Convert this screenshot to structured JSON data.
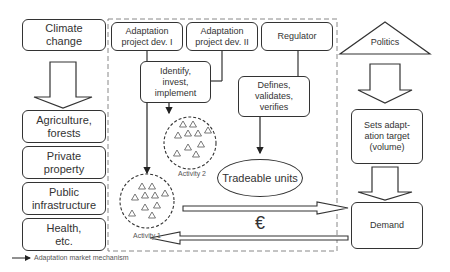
{
  "left_column": {
    "top": "Climate\nchange",
    "sectors": [
      "Agriculture,\nforests",
      "Private\nproperty",
      "Public\ninfrastructure",
      "Health,\netc."
    ]
  },
  "mechanism": {
    "dev1": "Adaptation\nproject dev. I",
    "dev2": "Adaptation\nproject dev. II",
    "regulator": "Regulator",
    "identify": "Identify,\ninvest,\nimplement",
    "defines": "Defines,\nvalidates,\nverifies",
    "activity1": "Activity 1",
    "activity2": "Activity 2",
    "tradeable": "Tradeable units",
    "currency": "€"
  },
  "right_column": {
    "politics": "Politics",
    "target": "Sets adapt-\nation target\n(volume)",
    "demand": "Demand"
  },
  "legend": {
    "label": "Adaptation market mechanism"
  }
}
